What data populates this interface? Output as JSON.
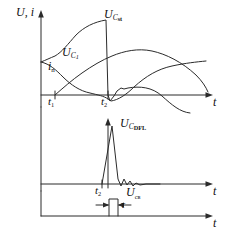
{
  "figure": {
    "type": "waveform-timing-diagram",
    "panels": [
      {
        "id": "panel-top",
        "y_axis_label": "U, i",
        "x_axis_label": "t",
        "time_markers": [
          {
            "name": "t1",
            "base": "t",
            "sub": "1"
          },
          {
            "name": "t2",
            "base": "t",
            "sub": "2"
          }
        ],
        "curves": [
          {
            "name": "U_Cst",
            "base": "U",
            "sub": "C",
            "sub2": "st",
            "shape": "rises S-curve from baseline to peak at t2 then drops sharply below axis, recovers to a dome, then falls through the axis"
          },
          {
            "name": "U_C1",
            "base": "U",
            "sub": "C",
            "sub2": "1",
            "shape": "starts at mid level, decays to zero crossing near t2, then rises again to a broad dome"
          },
          {
            "name": "i_n",
            "base": "i",
            "sub": "n",
            "shape": "rises from zero at t1, arcs to a maximum then descends monotonically"
          }
        ]
      },
      {
        "id": "panel-middle",
        "x_axis_label": "t",
        "time_markers": [
          {
            "name": "t2",
            "base": "t",
            "sub": "2"
          }
        ],
        "curves": [
          {
            "name": "U_CDFL",
            "base": "U",
            "sub": "C",
            "sub2": "DFL",
            "shape": "sharp narrow positive spike starting at t2, fast fall with small damped ringing tail"
          }
        ]
      },
      {
        "id": "panel-bottom",
        "x_axis_label": "t",
        "curves": [
          {
            "name": "U_cs",
            "base": "U",
            "sub2": "cв",
            "shape": "single narrow rectangular pulse of width tau"
          }
        ],
        "annotations": [
          {
            "name": "tau",
            "symbol": "τ",
            "meaning": "pulse width"
          }
        ]
      }
    ],
    "colors": {
      "stroke": "#2b2b2b",
      "axis": "#2b2b2b",
      "background": "#ffffff"
    }
  }
}
